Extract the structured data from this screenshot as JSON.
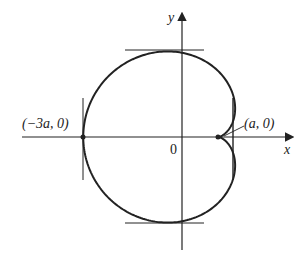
{
  "diagram": {
    "type": "cardioid",
    "axes": {
      "x_label": "x",
      "y_label": "y",
      "origin_label": "0"
    },
    "points": [
      {
        "label": "(−3a, 0)",
        "name": "leftmost-point"
      },
      {
        "label": "(a, 0)",
        "name": "cusp-point"
      }
    ],
    "tangent_lines": [
      "top horizontal",
      "bottom horizontal",
      "left vertical",
      "right vertical"
    ],
    "stroke_color": "#222222"
  }
}
